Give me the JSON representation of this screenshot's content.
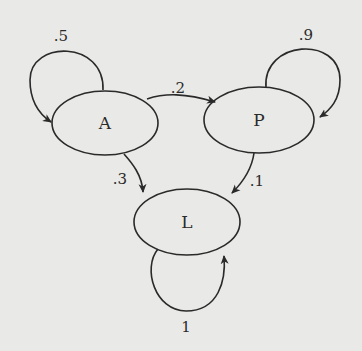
{
  "diagram": {
    "type": "markov-chain",
    "nodes": [
      {
        "id": "A",
        "label": "A"
      },
      {
        "id": "P",
        "label": "P"
      },
      {
        "id": "L",
        "label": "L"
      }
    ],
    "edges": [
      {
        "from": "A",
        "to": "A",
        "label": ".5"
      },
      {
        "from": "A",
        "to": "P",
        "label": ".2"
      },
      {
        "from": "A",
        "to": "L",
        "label": ".3"
      },
      {
        "from": "P",
        "to": "P",
        "label": ".9"
      },
      {
        "from": "P",
        "to": "L",
        "label": ".1"
      },
      {
        "from": "L",
        "to": "L",
        "label": "1"
      }
    ]
  }
}
